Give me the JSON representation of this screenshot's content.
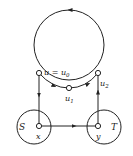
{
  "diagram": {
    "nodes": {
      "u0": {
        "label": "u = u",
        "sub": "0"
      },
      "u1": {
        "label": "u",
        "sub": "1"
      },
      "u2": {
        "label": "u",
        "sub": "2"
      },
      "x": {
        "label": "x"
      },
      "y": {
        "label": "y"
      }
    },
    "regions": {
      "S": {
        "label": "S"
      },
      "T": {
        "label": "T"
      }
    },
    "colors": {
      "stroke": "#222222",
      "background": "#ffffff"
    }
  }
}
